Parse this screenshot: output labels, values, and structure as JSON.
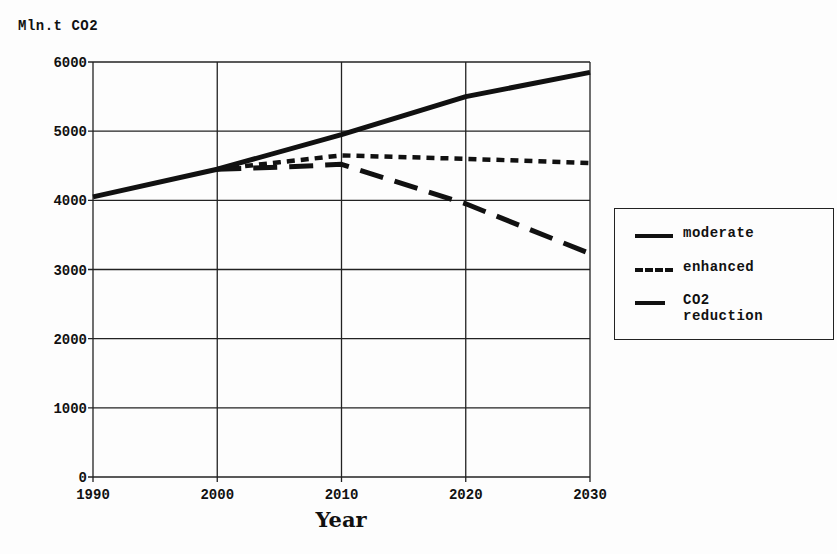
{
  "chart_data": {
    "type": "line",
    "title": "",
    "ylabel": "Mln.t CO2",
    "xlabel": "Year",
    "x": [
      1990,
      2000,
      2010,
      2020,
      2030
    ],
    "xlim": [
      1990,
      2030
    ],
    "ylim": [
      0,
      6000
    ],
    "yticks": [
      0,
      1000,
      2000,
      3000,
      4000,
      5000,
      6000
    ],
    "xticks": [
      1990,
      2000,
      2010,
      2020,
      2030
    ],
    "grid": true,
    "legend_position": "right",
    "series": [
      {
        "name": "moderate",
        "style": "solid",
        "x": [
          1990,
          2000,
          2010,
          2020,
          2030
        ],
        "values": [
          4050,
          4450,
          4950,
          5500,
          5850
        ]
      },
      {
        "name": "enhanced",
        "style": "dotted",
        "x": [
          2000,
          2005,
          2010,
          2020,
          2030
        ],
        "values": [
          4450,
          4550,
          4650,
          4600,
          4540
        ]
      },
      {
        "name": "CO2 reduction",
        "style": "dashed",
        "x": [
          2000,
          2005,
          2010,
          2020,
          2030
        ],
        "values": [
          4450,
          4480,
          4520,
          3950,
          3230
        ]
      }
    ]
  },
  "labels": {
    "y_title": "Mln.t CO2",
    "x_title": "Year",
    "legend": [
      "moderate",
      "enhanced",
      "CO2\nreduction"
    ]
  }
}
